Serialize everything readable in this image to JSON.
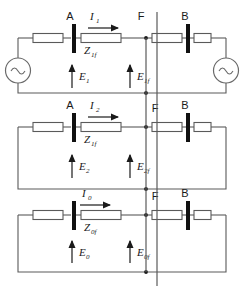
{
  "figure": {
    "width": 244,
    "height": 286,
    "background": "#ffffff",
    "wire_color": "#5a5a5a",
    "label_color": "#1a1a1a",
    "breaker_color": "#111111"
  },
  "sections": [
    {
      "id": "positive-sequence",
      "breaker_left": "A",
      "breaker_right": "B",
      "current": {
        "symbol": "I",
        "subscript": "1"
      },
      "impedance": {
        "symbol": "Z",
        "subscript": "1f"
      },
      "bus": "F",
      "emf_left": {
        "symbol": "E",
        "subscript": "1"
      },
      "emf_bus": {
        "symbol": "E",
        "subscript": "1f"
      },
      "has_sources": true,
      "source_left": "ac-source",
      "source_right": "ac-source"
    },
    {
      "id": "negative-sequence",
      "breaker_left": "A",
      "breaker_right": "B",
      "current": {
        "symbol": "I",
        "subscript": "2"
      },
      "impedance": {
        "symbol": "Z",
        "subscript": "1f"
      },
      "bus": "F",
      "emf_left": {
        "symbol": "E",
        "subscript": "2"
      },
      "emf_bus": {
        "symbol": "E",
        "subscript": "2f"
      },
      "has_sources": false,
      "source_left": "",
      "source_right": ""
    },
    {
      "id": "zero-sequence",
      "breaker_left": "",
      "breaker_right": "B",
      "current": {
        "symbol": "I",
        "subscript": "0"
      },
      "impedance": {
        "symbol": "Z",
        "subscript": "0f"
      },
      "bus": "F",
      "emf_left": {
        "symbol": "E",
        "subscript": "0"
      },
      "emf_bus": {
        "symbol": "E",
        "subscript": "0f"
      },
      "has_sources": false,
      "source_left": "",
      "source_right": ""
    }
  ],
  "icons": {
    "ac_source": "ac-source-icon",
    "circuit_breaker": "circuit-breaker-icon",
    "impedance_block": "impedance-block-icon",
    "junction_node": "junction-node-icon",
    "current_arrow": "current-arrow-icon",
    "voltage_arrow": "voltage-arrow-icon"
  }
}
